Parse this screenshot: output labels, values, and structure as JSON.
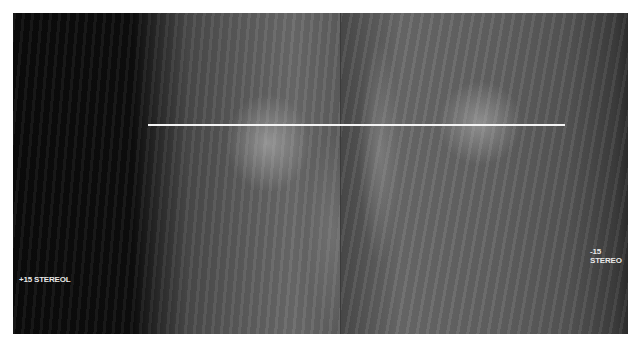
{
  "image": {
    "description": "Stereo mammography pair with horizontal reference line",
    "left_view_label": "+15 STEREOL",
    "right_view_label": "-15 STEREO"
  },
  "colors": {
    "background": "#ffffff",
    "image_dark": "#0a0a0a",
    "reference_line": "#f4f4f4",
    "label_text": "#e8e8e8"
  }
}
